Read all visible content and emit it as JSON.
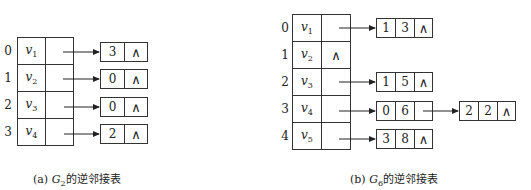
{
  "figure_a": {
    "caption_prefix": "(a) ",
    "caption_graph": "G",
    "caption_sub": "2",
    "caption_suffix": "的逆邻接表",
    "rows": [
      {
        "index": "0",
        "vertex": "v",
        "vsub": "1",
        "nodes": [
          [
            "3",
            "∧"
          ]
        ]
      },
      {
        "index": "1",
        "vertex": "v",
        "vsub": "2",
        "nodes": [
          [
            "0",
            "∧"
          ]
        ]
      },
      {
        "index": "2",
        "vertex": "v",
        "vsub": "3",
        "nodes": [
          [
            "0",
            "∧"
          ]
        ]
      },
      {
        "index": "3",
        "vertex": "v",
        "vsub": "4",
        "nodes": [
          [
            "2",
            "∧"
          ]
        ]
      }
    ]
  },
  "figure_b": {
    "caption_prefix": "(b) ",
    "caption_graph": "G",
    "caption_sub": "6",
    "caption_suffix": "的逆邻接表",
    "null_symbol": "∧",
    "rows": [
      {
        "index": "0",
        "vertex": "v",
        "vsub": "1",
        "nodes": [
          [
            "1",
            "3",
            "∧"
          ]
        ]
      },
      {
        "index": "1",
        "vertex": "v",
        "vsub": "2",
        "nodes": [],
        "pointer": "∧"
      },
      {
        "index": "2",
        "vertex": "v",
        "vsub": "3",
        "nodes": [
          [
            "1",
            "5",
            "∧"
          ]
        ]
      },
      {
        "index": "3",
        "vertex": "v",
        "vsub": "4",
        "nodes": [
          [
            "0",
            "6",
            ""
          ],
          [
            "2",
            "2",
            "∧"
          ]
        ]
      },
      {
        "index": "4",
        "vertex": "v",
        "vsub": "5",
        "nodes": [
          [
            "3",
            "8",
            "∧"
          ]
        ]
      }
    ]
  }
}
